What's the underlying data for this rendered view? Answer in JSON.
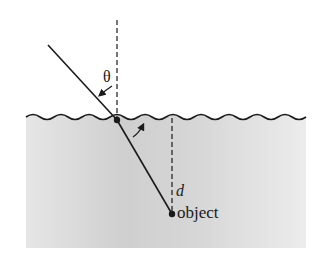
{
  "diagram": {
    "labels": {
      "theta": "θ",
      "depth": "d",
      "object": "object"
    },
    "colors": {
      "ink": "#1a1a1a",
      "water_top": "#c9c9c9",
      "water_bottom": "#e8e8e8"
    },
    "elements": [
      "normal-line-dashed",
      "incident-ray",
      "water-surface",
      "refracted-ray",
      "depth-line-dashed",
      "object-point",
      "angle-arrows"
    ]
  }
}
